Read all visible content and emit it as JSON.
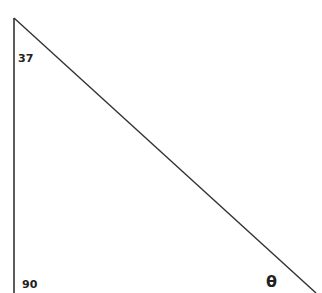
{
  "diagram": {
    "type": "right-triangle",
    "vertices": {
      "top": [
        14,
        18
      ],
      "bottom_left": [
        14,
        293
      ],
      "bottom_right": [
        316,
        293
      ]
    },
    "labels": {
      "top_angle": "37",
      "right_angle": "90",
      "unknown_angle": "θ"
    },
    "line_color": "#333333"
  }
}
